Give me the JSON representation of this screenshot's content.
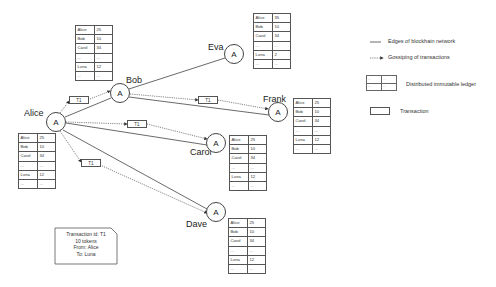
{
  "nodes": {
    "alice": {
      "label": "Alice",
      "glyph": "A"
    },
    "bob": {
      "label": "Bob",
      "glyph": "A"
    },
    "eva": {
      "label": "Eva",
      "glyph": "A"
    },
    "frank": {
      "label": "Frank",
      "glyph": "A"
    },
    "carol": {
      "label": "Carol",
      "glyph": "A"
    },
    "dave": {
      "label": "Dave",
      "glyph": "A"
    }
  },
  "ledgers": {
    "bob": [
      [
        "Alice",
        "25"
      ],
      [
        "Bob",
        "10"
      ],
      [
        "Carol",
        "34"
      ],
      [
        "...",
        "..."
      ],
      [
        "Luna",
        "12"
      ],
      [
        "...",
        "..."
      ]
    ],
    "eva": [
      [
        "Alice",
        "35"
      ],
      [
        "Bob",
        "10"
      ],
      [
        "Carol",
        "34"
      ],
      [
        "...",
        "..."
      ],
      [
        "Luna",
        "2"
      ],
      [
        "...",
        "..."
      ]
    ],
    "frank": [
      [
        "Alice",
        "25"
      ],
      [
        "Bob",
        "10"
      ],
      [
        "Carol",
        "34"
      ],
      [
        "...",
        "..."
      ],
      [
        "Luna",
        "12"
      ],
      [
        "...",
        "..."
      ]
    ],
    "alice": [
      [
        "Alice",
        "25"
      ],
      [
        "Bob",
        "10"
      ],
      [
        "Carol",
        "34"
      ],
      [
        "...",
        "..."
      ],
      [
        "Luna",
        "12"
      ],
      [
        "...",
        "..."
      ]
    ],
    "carol": [
      [
        "Alice",
        "25"
      ],
      [
        "Bob",
        "10"
      ],
      [
        "Carol",
        "34"
      ],
      [
        "...",
        "..."
      ],
      [
        "Luna",
        "12"
      ],
      [
        "...",
        "..."
      ]
    ],
    "dave": [
      [
        "Alice",
        "25"
      ],
      [
        "Bob",
        "10"
      ],
      [
        "Carol",
        "34"
      ],
      [
        "...",
        "..."
      ],
      [
        "Luna",
        "12"
      ],
      [
        "...",
        "..."
      ]
    ]
  },
  "transactions": [
    {
      "label": "T1"
    },
    {
      "label": "T1"
    },
    {
      "label": "T1"
    },
    {
      "label": "T1"
    }
  ],
  "note": {
    "lines": [
      "Transaction id: T1",
      "10 tokens",
      "From: Alice",
      "To: Luna"
    ]
  },
  "legend": {
    "edges": "Edges of blockhain network",
    "gossip": "Gossiping of transactions",
    "ledger": "Distributed immutable ledger",
    "transaction": "Transaction",
    "ledger_cells": [
      "...",
      "...",
      "...",
      "..."
    ]
  }
}
